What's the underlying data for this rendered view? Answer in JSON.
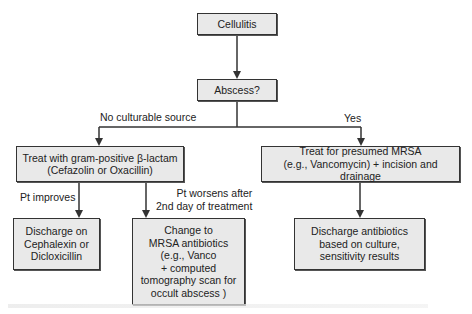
{
  "nodes": {
    "cellulitis": "Cellulitis",
    "abscess": "Abscess?",
    "treat_gram_positive": "Treat with gram-positive β-lactam\n(Cefazolin or Oxacillin)",
    "treat_mrsa": "Treat for presumed MRSA\n(e.g., Vancomycin) + incision and drainage",
    "discharge_cephalexin": "Discharge on\nCephalexin or\nDicloxicillin",
    "change_mrsa": "Change to\nMRSA antibiotics\n(e.g., Vanco\n+ computed\ntomography scan for\noccult abscess )",
    "discharge_culture": "Discharge antibiotics\nbased on culture,\nsensitivity results"
  },
  "edge_labels": {
    "no_source": "No culturable source",
    "yes": "Yes",
    "pt_improves": "Pt improves",
    "pt_worsens": "Pt worsens after\n2nd day of treatment"
  },
  "colors": {
    "box_fill": "#e9e9e9",
    "box_border": "#333333",
    "line": "#333333"
  }
}
